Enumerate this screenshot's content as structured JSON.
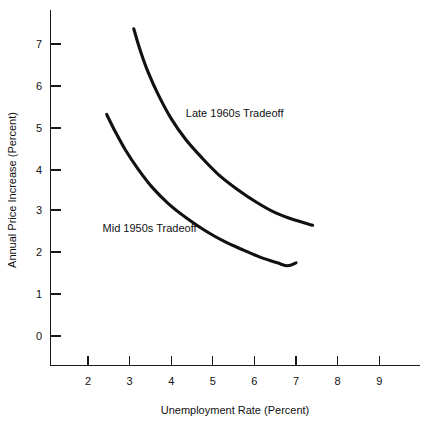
{
  "chart_data": {
    "type": "line",
    "title": "",
    "subtitle": "",
    "xlabel": "Unemployment Rate (Percent)",
    "ylabel": "Annual Price Increase  (Percent)",
    "xlim": [
      1.2,
      9.8
    ],
    "ylim": [
      -0.45,
      7.9
    ],
    "xticks": [
      2,
      3,
      4,
      5,
      6,
      7,
      8,
      9
    ],
    "xticklabels": [
      "2",
      "3",
      "4",
      "5",
      "6",
      "7",
      "8",
      "9"
    ],
    "yticks": [
      0,
      1,
      2,
      3,
      4,
      5,
      6,
      7
    ],
    "yticklabels": [
      "0",
      "1",
      "2",
      "3",
      "4",
      "5",
      "6",
      "7"
    ],
    "grid": false,
    "legend_position": "inline-annotation",
    "series": [
      {
        "name": "Late 1960s Tradeoff",
        "label": "Late 1960s Tradeoff",
        "color": "#111111",
        "x": [
          3.1,
          3.25,
          3.45,
          3.7,
          4.0,
          4.35,
          4.75,
          5.15,
          5.6,
          6.05,
          6.5,
          6.95,
          7.4
        ],
        "y": [
          7.35,
          6.85,
          6.3,
          5.75,
          5.2,
          4.7,
          4.25,
          3.85,
          3.5,
          3.2,
          2.95,
          2.78,
          2.65
        ],
        "label_position": {
          "x": 4.35,
          "y": 5.25
        }
      },
      {
        "name": "Mid 1950s Tradeoff",
        "label": "Mid 1950s Tradeoff",
        "color": "#111111",
        "x": [
          2.45,
          2.65,
          2.9,
          3.2,
          3.55,
          3.95,
          4.4,
          4.85,
          5.3,
          5.75,
          6.15,
          6.55,
          6.8,
          7.0
        ],
        "y": [
          5.3,
          4.9,
          4.45,
          4.0,
          3.55,
          3.15,
          2.8,
          2.5,
          2.25,
          2.05,
          1.88,
          1.75,
          1.68,
          1.75
        ],
        "label_position": {
          "x": 2.35,
          "y": 2.48
        }
      }
    ]
  },
  "axes": {
    "x_axis_name": "unemployment-rate-axis",
    "y_axis_name": "annual-price-increase-axis"
  }
}
